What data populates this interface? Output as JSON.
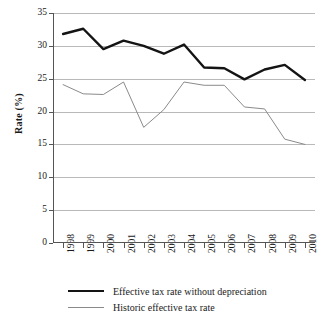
{
  "chart_data": {
    "type": "line",
    "title": "",
    "xlabel": "",
    "ylabel": "Rate (%)",
    "ylim": [
      0,
      35
    ],
    "yticks": [
      0,
      5,
      10,
      15,
      20,
      25,
      30,
      35
    ],
    "grid": "horizontal",
    "legend_position": "bottom",
    "categories": [
      "1998",
      "1999",
      "2000",
      "2001",
      "2002",
      "2003",
      "2004",
      "2005",
      "2006",
      "2007",
      "2008",
      "2009",
      "2010"
    ],
    "series": [
      {
        "name": "Effective tax rate without depreciation",
        "color": "#141414",
        "width": 2.4,
        "values": [
          31.8,
          32.6,
          29.5,
          30.8,
          30.0,
          28.8,
          30.2,
          26.7,
          26.6,
          24.9,
          26.4,
          27.1,
          24.8
        ]
      },
      {
        "name": "Historic effective tax rate",
        "color": "#8a8a8a",
        "width": 1.0,
        "values": [
          24.1,
          22.7,
          22.6,
          24.5,
          17.6,
          20.3,
          24.5,
          24.0,
          24.0,
          20.7,
          20.4,
          15.8,
          15.0
        ]
      }
    ]
  }
}
